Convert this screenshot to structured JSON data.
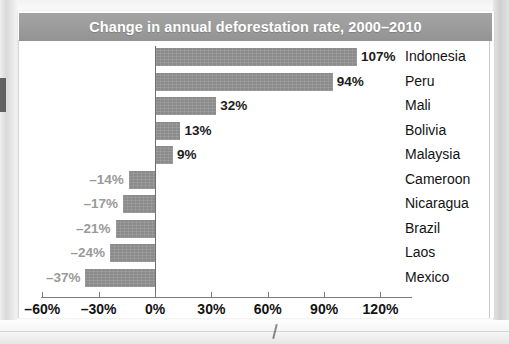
{
  "figure": {
    "title": "Change in annual deforestation rate, 2000–2010",
    "title_bar_color": "#9c9c9c",
    "bar_color": "#8b8b8b",
    "positive_label_color": "#1c1c1c",
    "negative_label_color": "#9a9a9a"
  },
  "chart_data": {
    "type": "bar",
    "orientation": "horizontal",
    "title": "Change in annual deforestation rate, 2000–2010",
    "xlabel": "",
    "ylabel": "",
    "xlim": [
      -60,
      120
    ],
    "xticks": [
      -60,
      -30,
      0,
      30,
      60,
      90,
      120
    ],
    "xtick_labels": [
      "–60%",
      "–30%",
      "0%",
      "30%",
      "60%",
      "90%",
      "120%"
    ],
    "grid": false,
    "legend": "none",
    "categories": [
      "Indonesia",
      "Peru",
      "Mali",
      "Bolivia",
      "Malaysia",
      "Cameroon",
      "Nicaragua",
      "Brazil",
      "Laos",
      "Mexico"
    ],
    "values": [
      107,
      94,
      32,
      13,
      9,
      -14,
      -17,
      -21,
      -24,
      -37
    ],
    "data_labels": [
      "107%",
      "94%",
      "32%",
      "13%",
      "9%",
      "–14%",
      "–17%",
      "–21%",
      "–24%",
      "–37%"
    ],
    "series": [
      {
        "name": "Change in annual deforestation rate, 2000–2010",
        "values": [
          107,
          94,
          32,
          13,
          9,
          -14,
          -17,
          -21,
          -24,
          -37
        ]
      }
    ],
    "rows": [
      {
        "country": "Indonesia",
        "value": 107,
        "label": "107%",
        "sign": "pos"
      },
      {
        "country": "Peru",
        "value": 94,
        "label": "94%",
        "sign": "pos"
      },
      {
        "country": "Mali",
        "value": 32,
        "label": "32%",
        "sign": "pos"
      },
      {
        "country": "Bolivia",
        "value": 13,
        "label": "13%",
        "sign": "pos"
      },
      {
        "country": "Malaysia",
        "value": 9,
        "label": "9%",
        "sign": "pos"
      },
      {
        "country": "Cameroon",
        "value": -14,
        "label": "–14%",
        "sign": "neg"
      },
      {
        "country": "Nicaragua",
        "value": -17,
        "label": "–17%",
        "sign": "neg"
      },
      {
        "country": "Brazil",
        "value": -21,
        "label": "–21%",
        "sign": "neg"
      },
      {
        "country": "Laos",
        "value": -24,
        "label": "–24%",
        "sign": "neg"
      },
      {
        "country": "Mexico",
        "value": -37,
        "label": "–37%",
        "sign": "neg"
      }
    ]
  }
}
